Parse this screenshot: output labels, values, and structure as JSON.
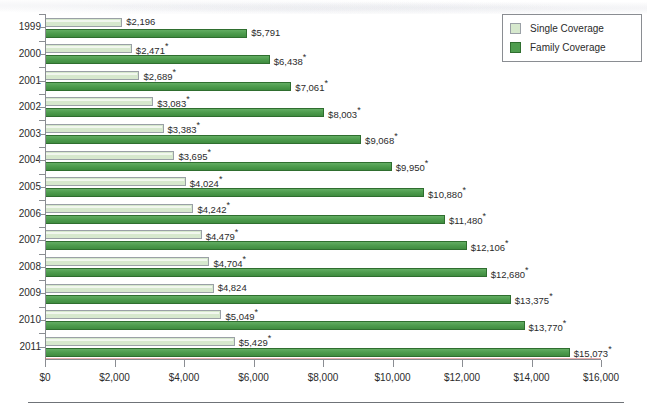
{
  "legend": {
    "items": [
      {
        "label": "Single Coverage",
        "key": "single",
        "color": "#d6e8cd"
      },
      {
        "label": "Family Coverage",
        "key": "family",
        "color": "#4f9d4f"
      }
    ]
  },
  "xaxis": {
    "ticks": [
      "$0",
      "$2,000",
      "$4,000",
      "$6,000",
      "$8,000",
      "$10,000",
      "$12,000",
      "$14,000",
      "$16,000"
    ]
  },
  "rows": [
    {
      "year": "1999",
      "single_label": "$2,196",
      "single_star": "",
      "family_label": "$5,791",
      "family_star": ""
    },
    {
      "year": "2000",
      "single_label": "$2,471",
      "single_star": "*",
      "family_label": "$6,438",
      "family_star": "*"
    },
    {
      "year": "2001",
      "single_label": "$2,689",
      "single_star": "*",
      "family_label": "$7,061",
      "family_star": "*"
    },
    {
      "year": "2002",
      "single_label": "$3,083",
      "single_star": "*",
      "family_label": "$8,003",
      "family_star": "*"
    },
    {
      "year": "2003",
      "single_label": "$3,383",
      "single_star": "*",
      "family_label": "$9,068",
      "family_star": "*"
    },
    {
      "year": "2004",
      "single_label": "$3,695",
      "single_star": "*",
      "family_label": "$9,950",
      "family_star": "*"
    },
    {
      "year": "2005",
      "single_label": "$4,024",
      "single_star": "*",
      "family_label": "$10,880",
      "family_star": "*"
    },
    {
      "year": "2006",
      "single_label": "$4,242",
      "single_star": "*",
      "family_label": "$11,480",
      "family_star": "*"
    },
    {
      "year": "2007",
      "single_label": "$4,479",
      "single_star": "*",
      "family_label": "$12,106",
      "family_star": "*"
    },
    {
      "year": "2008",
      "single_label": "$4,704",
      "single_star": "*",
      "family_label": "$12,680",
      "family_star": "*"
    },
    {
      "year": "2009",
      "single_label": "$4,824",
      "single_star": "",
      "family_label": "$13,375",
      "family_star": "*"
    },
    {
      "year": "2010",
      "single_label": "$5,049",
      "single_star": "*",
      "family_label": "$13,770",
      "family_star": "*"
    },
    {
      "year": "2011",
      "single_label": "$5,429",
      "single_star": "*",
      "family_label": "$15,073",
      "family_star": "*"
    }
  ],
  "chart_data": {
    "type": "bar",
    "orientation": "horizontal",
    "title": "",
    "xlabel": "",
    "ylabel": "",
    "xlim": [
      0,
      16000
    ],
    "xticks": [
      0,
      2000,
      4000,
      6000,
      8000,
      10000,
      12000,
      14000,
      16000
    ],
    "grid": false,
    "legend_position": "top-right",
    "categories": [
      "1999",
      "2000",
      "2001",
      "2002",
      "2003",
      "2004",
      "2005",
      "2006",
      "2007",
      "2008",
      "2009",
      "2010",
      "2011"
    ],
    "series": [
      {
        "name": "Single Coverage",
        "color": "#d6e8cd",
        "values": [
          2196,
          2471,
          2689,
          3083,
          3383,
          3695,
          4024,
          4242,
          4479,
          4704,
          4824,
          5049,
          5429
        ],
        "data_labels": [
          "$2,196",
          "$2,471*",
          "$2,689*",
          "$3,083*",
          "$3,383*",
          "$3,695*",
          "$4,024*",
          "$4,242*",
          "$4,479*",
          "$4,704*",
          "$4,824",
          "$5,049*",
          "$5,429*"
        ]
      },
      {
        "name": "Family Coverage",
        "color": "#4f9d4f",
        "values": [
          5791,
          6438,
          7061,
          8003,
          9068,
          9950,
          10880,
          11480,
          12106,
          12680,
          13375,
          13770,
          15073
        ],
        "data_labels": [
          "$5,791",
          "$6,438*",
          "$7,061*",
          "$8,003*",
          "$9,068*",
          "$9,950*",
          "$10,880*",
          "$11,480*",
          "$12,106*",
          "$12,680*",
          "$13,375*",
          "$13,770*",
          "$15,073*"
        ]
      }
    ]
  }
}
